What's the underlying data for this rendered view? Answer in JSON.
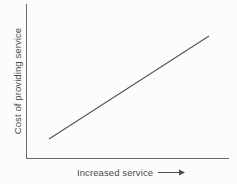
{
  "figure": {
    "background_color": "#fcfcfc",
    "axis_color": "#6a6a6a",
    "line_color": "#555555",
    "text_color": "#4a4a4a"
  },
  "chart_data": {
    "type": "line",
    "title": "",
    "subtitle": "",
    "xlabel": "Increased service",
    "ylabel": "Cost of providing service",
    "xlabel_suffix_icon": "right-arrow-icon",
    "grid": false,
    "legend": null,
    "axis_ticks": {
      "x": [],
      "y": []
    },
    "xlim": [
      0,
      1
    ],
    "ylim": [
      0,
      1
    ],
    "series": [
      {
        "name": "Cost of providing service",
        "x": [
          0.113,
          1.0
        ],
        "y": [
          0.123,
          0.792
        ],
        "style": "solid",
        "annotation": "linear increasing relationship"
      }
    ]
  },
  "geometry": {
    "y_axis": {
      "x": 26,
      "y_top": 4,
      "y_bottom": 158
    },
    "x_axis": {
      "y": 158,
      "x_left": 26,
      "x_right": 229
    },
    "data_line": {
      "x1": 49,
      "y1": 139,
      "x2": 209,
      "y2": 36
    },
    "x_label_arrow": {
      "x1": 143,
      "x2": 168,
      "y": 172
    }
  }
}
